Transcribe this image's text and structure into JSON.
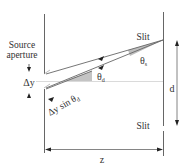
{
  "diagram": {
    "labels": {
      "source_aperture_line1": "Source",
      "source_aperture_line2": "aperture",
      "delta_y": "Δy",
      "delta_y_sin": "Δy sin θ",
      "delta_y_sin_sub": "d",
      "theta_d": "θ",
      "theta_d_sub": "d",
      "theta_s": "θ",
      "theta_s_sub": "s",
      "slit_top": "Slit",
      "slit_bottom": "Slit",
      "d": "d",
      "z": "z"
    },
    "colors": {
      "line": "#555555",
      "wedge": "#bdbdbd",
      "dashed": "#c8c8c8",
      "text": "#333333"
    }
  }
}
